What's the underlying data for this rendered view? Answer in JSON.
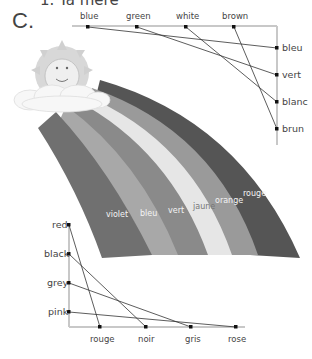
{
  "header": {
    "cutoff_text": "1. Ta mere",
    "section_label": "C."
  },
  "top_match": {
    "english": [
      "blue",
      "green",
      "white",
      "brown"
    ],
    "french": [
      "bleu",
      "vert",
      "blanc",
      "brun"
    ],
    "pairs": [
      [
        "blue",
        "bleu"
      ],
      [
        "green",
        "vert"
      ],
      [
        "white",
        "blanc"
      ],
      [
        "brown",
        "brun"
      ]
    ]
  },
  "rainbow": {
    "bands": [
      {
        "label": "violet",
        "color": "#707070"
      },
      {
        "label": "bleu",
        "color": "#a8a8a8"
      },
      {
        "label": "vert",
        "color": "#8a8a8a"
      },
      {
        "label": "jaune",
        "color": "#e6e6e6"
      },
      {
        "label": "orange",
        "color": "#9a9a9a"
      },
      {
        "label": "rouge",
        "color": "#555555"
      }
    ]
  },
  "bottom_match": {
    "english": [
      "red",
      "black",
      "grey",
      "pink"
    ],
    "french": [
      "rouge",
      "noir",
      "gris",
      "rose"
    ],
    "pairs": [
      [
        "red",
        "rouge"
      ],
      [
        "black",
        "noir"
      ],
      [
        "grey",
        "gris"
      ],
      [
        "pink",
        "rose"
      ]
    ]
  }
}
